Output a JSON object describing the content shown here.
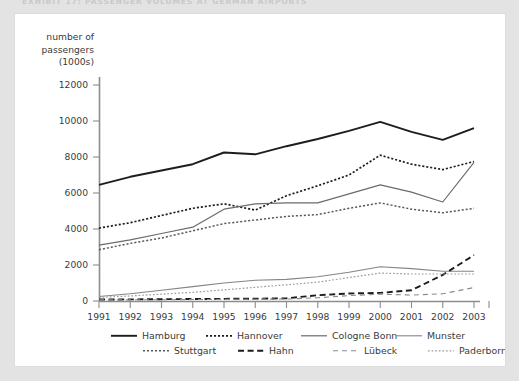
{
  "exhibit": {
    "title": "Exhibit 17: Passenger volumes at German airports"
  },
  "chart_data": {
    "type": "line",
    "title": "",
    "xlabel": "",
    "ylabel": "number of passengers (1000s)",
    "ylabel_lines": [
      "number of",
      "passengers",
      "(1000s)"
    ],
    "categories": [
      "1991",
      "1992",
      "1993",
      "1994",
      "1995",
      "1996",
      "1997",
      "1998",
      "1999",
      "2000",
      "2001",
      "2002",
      "2003"
    ],
    "x": [
      1991,
      1992,
      1993,
      1994,
      1995,
      1996,
      1997,
      1998,
      1999,
      2000,
      2001,
      2002,
      2003
    ],
    "ylim": [
      0,
      13000
    ],
    "yticks": [
      0,
      2000,
      4000,
      6000,
      8000,
      10000,
      12000
    ],
    "ytick_labels": [
      "0",
      "2000",
      "4000",
      "6000",
      "8000",
      "10000",
      "12000"
    ],
    "grid": false,
    "legend_position": "bottom",
    "series": [
      {
        "name": "Hamburg",
        "style": "solid",
        "width": 1.9,
        "color": "#1d1d1d",
        "values": [
          6450,
          6900,
          7250,
          7600,
          8250,
          8150,
          8600,
          9000,
          9450,
          9950,
          9400,
          8950,
          9600
        ]
      },
      {
        "name": "Hannover",
        "style": "dotted",
        "width": 1.7,
        "color": "#1d1d1d",
        "values": [
          4050,
          4350,
          4750,
          5150,
          5400,
          5050,
          5850,
          6400,
          7000,
          8100,
          7600,
          7300,
          7750
        ]
      },
      {
        "name": "Cologne Bonn",
        "style": "solid",
        "width": 1.2,
        "color": "#6b6b70",
        "values": [
          3100,
          3400,
          3750,
          4100,
          5100,
          5400,
          5450,
          5450,
          5950,
          6450,
          6050,
          5500,
          7700
        ]
      },
      {
        "name": "Munster",
        "style": "solid",
        "width": 1.1,
        "color": "#84848a",
        "values": [
          250,
          400,
          600,
          800,
          1000,
          1150,
          1200,
          1350,
          1600,
          1900,
          1800,
          1650,
          1650
        ]
      },
      {
        "name": "Stuttgart",
        "style": "dotted",
        "width": 1.5,
        "color": "#5a5a60",
        "values": [
          2850,
          3200,
          3500,
          3900,
          4300,
          4500,
          4700,
          4800,
          5150,
          5450,
          5100,
          4900,
          5150
        ]
      },
      {
        "name": "Hahn",
        "style": "dashed-thick",
        "width": 1.9,
        "color": "#1d1d1d",
        "values": [
          80,
          90,
          100,
          110,
          120,
          130,
          150,
          320,
          420,
          450,
          600,
          1450,
          2550
        ]
      },
      {
        "name": "Lübeck",
        "style": "dashed-thin",
        "width": 1.1,
        "color": "#8a8a90",
        "values": [
          60,
          65,
          70,
          80,
          90,
          100,
          110,
          180,
          300,
          380,
          330,
          400,
          750
        ]
      },
      {
        "name": "Paderborn",
        "style": "dotted-thin",
        "width": 1.2,
        "color": "#9a9aa0",
        "values": [
          200,
          280,
          380,
          480,
          620,
          760,
          900,
          1050,
          1300,
          1550,
          1500,
          1500,
          1500
        ]
      }
    ]
  }
}
